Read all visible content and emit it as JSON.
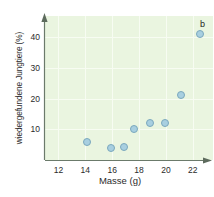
{
  "chart_data": {
    "type": "scatter",
    "title": "",
    "panel_label": "b",
    "xlabel": "Masse (g)",
    "ylabel": "wiedergefundene Jungtiere (%)",
    "xlim": [
      11.0,
      23.5
    ],
    "ylim": [
      0,
      47
    ],
    "xticks": [
      12,
      14,
      16,
      18,
      20,
      22
    ],
    "yticks": [
      10,
      20,
      30,
      40
    ],
    "grid": true,
    "legend": "none",
    "marker_color": "#a8cfe0",
    "marker_edge_color": "#7ba8bd",
    "plot_background": "#eaf5e0",
    "gridline_color": "#f7fcf2",
    "axis_color": "#6b7a6b",
    "series": [
      {
        "name": "wiedergefundene Jungtiere",
        "points": [
          {
            "x": 14.1,
            "y": 6.0
          },
          {
            "x": 15.9,
            "y": 3.8
          },
          {
            "x": 16.9,
            "y": 4.4
          },
          {
            "x": 17.6,
            "y": 10.0
          },
          {
            "x": 18.8,
            "y": 12.2
          },
          {
            "x": 19.9,
            "y": 12.0
          },
          {
            "x": 21.1,
            "y": 21.2
          },
          {
            "x": 22.5,
            "y": 41.0
          }
        ]
      }
    ]
  }
}
